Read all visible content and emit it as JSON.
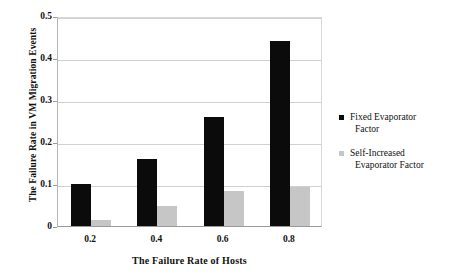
{
  "chart_data": {
    "type": "bar",
    "title": "",
    "xlabel": "The Failure Rate of Hosts",
    "ylabel": "The Failure Rate in VM Migration Events",
    "categories": [
      "0.2",
      "0.4",
      "0.6",
      "0.8"
    ],
    "ylim": [
      0,
      0.5
    ],
    "yticks": [
      "0",
      "0.1",
      "0.2",
      "0.3",
      "0.4",
      "0.5"
    ],
    "ytick_values": [
      0,
      0.1,
      0.2,
      0.3,
      0.4,
      0.5
    ],
    "grid": "horizontal",
    "legend_position": "right",
    "series": [
      {
        "name": "Fixed Evaporator Factor",
        "name_line1": "Fixed Evaporator",
        "name_line2": "Factor",
        "color": "#0b0b0b",
        "values": [
          0.1,
          0.16,
          0.26,
          0.44
        ]
      },
      {
        "name": "Self-Increased Evaporator Factor",
        "name_line1": "Self-Increased",
        "name_line2": "Evaporator Factor",
        "color": "#c6c6c6",
        "values": [
          0.015,
          0.048,
          0.083,
          0.093
        ]
      }
    ]
  }
}
